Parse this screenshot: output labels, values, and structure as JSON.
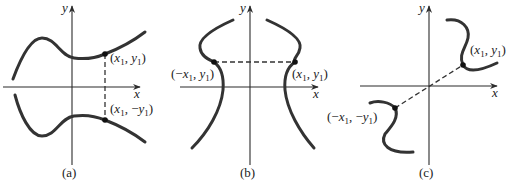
{
  "figure": {
    "panels": [
      {
        "id": "a",
        "caption": "(a)",
        "x_axis_label": "x",
        "y_axis_label": "y",
        "symmetry": "symmetric about x-axis",
        "points": [
          {
            "label_var": "x",
            "label_sign": "",
            "label_var2": "y",
            "label_sign2": "",
            "sub": "1"
          },
          {
            "label_var": "x",
            "label_sign": "",
            "label_var2": "y",
            "label_sign2": "−",
            "sub": "1"
          }
        ]
      },
      {
        "id": "b",
        "caption": "(b)",
        "x_axis_label": "x",
        "y_axis_label": "y",
        "symmetry": "symmetric about y-axis",
        "points": [
          {
            "label_var": "x",
            "label_sign": "−",
            "label_var2": "y",
            "label_sign2": "",
            "sub": "1"
          },
          {
            "label_var": "x",
            "label_sign": "",
            "label_var2": "y",
            "label_sign2": "",
            "sub": "1"
          }
        ]
      },
      {
        "id": "c",
        "caption": "(c)",
        "x_axis_label": "x",
        "y_axis_label": "y",
        "symmetry": "symmetric about origin",
        "points": [
          {
            "label_var": "x",
            "label_sign": "",
            "label_var2": "y",
            "label_sign2": "",
            "sub": "1"
          },
          {
            "label_var": "x",
            "label_sign": "−",
            "label_var2": "y",
            "label_sign2": "−",
            "sub": "1"
          }
        ]
      }
    ],
    "colors": {
      "curve": "#333333",
      "axis": "#2b2b2b",
      "background": "#ffffff"
    }
  }
}
